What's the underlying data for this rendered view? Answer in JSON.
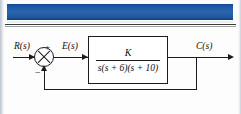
{
  "page": {
    "background_color": "#fdfdfd",
    "banner_color": "#2a66ae"
  },
  "diagram": {
    "type": "control-system-block-diagram",
    "input_label": "R(s)",
    "error_label": "E(s)",
    "output_label": "C(s)",
    "summing_junction": {
      "name": "summing-junction",
      "positive_sign": "+",
      "negative_sign": "−"
    },
    "transfer_function": {
      "numerator": "K",
      "denominator": "s(s + 6)(s + 10)"
    },
    "feedback": {
      "type": "unity-negative-feedback"
    }
  },
  "caption": {
    "figure_label": "FIGURE 8.17",
    "text": ""
  }
}
